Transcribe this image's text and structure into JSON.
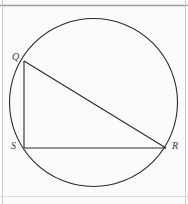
{
  "figure": {
    "kind": "geometry-diagram",
    "canvas": {
      "width": 188,
      "height": 204,
      "background": "#fbfbfb"
    },
    "rules": {
      "top_rule_color": "#9a9ca0",
      "bottom_rule_color": "#d8dadd",
      "side_rule_color": "#c9cbce",
      "top_rule_y": 5,
      "bottom_rule_y": 196,
      "left_rule_x": 2,
      "right_rule_x": 185
    },
    "circle": {
      "name": "circumscribed-circle",
      "center_x": 93.5,
      "center_y": 102.5,
      "radius": 84,
      "stroke": "#2a2a2a",
      "stroke_width": 1.1,
      "fill": "none"
    },
    "points": [
      {
        "id": "Q",
        "label": "Q",
        "x": 24,
        "y": 61
      },
      {
        "id": "S",
        "label": "S",
        "x": 24,
        "y": 148
      },
      {
        "id": "R",
        "label": "R",
        "x": 166,
        "y": 148
      }
    ],
    "segments": [
      {
        "id": "QS",
        "name": "chord-q-s",
        "from": "Q",
        "to": "S",
        "x1": 24,
        "y1": 61,
        "x2": 24,
        "y2": 148,
        "stroke": "#2a2a2a",
        "stroke_width": 1.1
      },
      {
        "id": "QR",
        "name": "chord-q-r",
        "from": "Q",
        "to": "R",
        "x1": 24,
        "y1": 61,
        "x2": 166,
        "y2": 148,
        "stroke": "#2a2a2a",
        "stroke_width": 1.1
      },
      {
        "id": "SR",
        "name": "chord-s-r",
        "from": "S",
        "to": "R",
        "x1": 24,
        "y1": 148,
        "x2": 166,
        "y2": 148,
        "stroke": "#2a2a2a",
        "stroke_width": 1.1
      }
    ],
    "labels": {
      "Q": "Q",
      "S": "S",
      "R": "R"
    }
  }
}
